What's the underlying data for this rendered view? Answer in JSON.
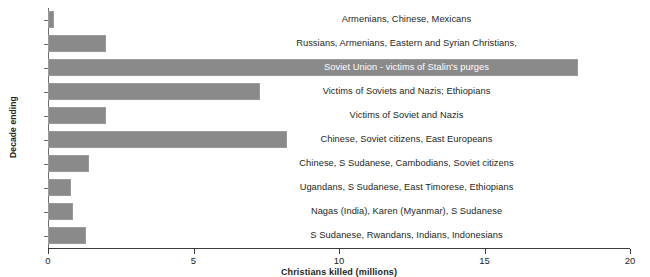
{
  "chart_data": {
    "type": "bar",
    "orientation": "horizontal",
    "title": "",
    "xlabel": "Christians killed (millions)",
    "ylabel": "Decade ending",
    "xlim": [
      0,
      20
    ],
    "xticks": [
      0,
      5,
      10,
      15,
      20
    ],
    "xtick_labels": [
      "0",
      "5",
      "10",
      "15",
      "20"
    ],
    "grid": false,
    "legend": "none",
    "bar_color": "#8a8a8a",
    "highlight_text_color": "#ffffff",
    "categories": [
      "1910",
      "1920",
      "1930",
      "1940",
      "1950",
      "1960",
      "1970",
      "1980",
      "1990",
      "2000"
    ],
    "values": [
      0.2,
      2.0,
      18.2,
      7.3,
      2.0,
      8.2,
      1.4,
      0.8,
      0.85,
      1.3
    ],
    "annotations": [
      "Armenians, Chinese, Mexicans",
      "Russians, Armenians, Eastern and Syrian Christians,",
      "Soviet Union - victims of Stalin's purges",
      "Victims of Soviets and Nazis; Ethiopians",
      "Victims of Soviet and Nazis",
      "Chinese, Soviet citizens, East Europeans",
      "Chinese, S Sudanese, Cambodians, Soviet citizens",
      "Ugandans, S Sudanese, East Timorese, Ethiopians",
      "Nagas (India), Karen (Myanmar),  S Sudanese",
      "S Sudanese, Rwandans, Indians, Indonesians"
    ],
    "annotation_on_bar": [
      false,
      false,
      true,
      false,
      false,
      false,
      false,
      false,
      false,
      false
    ]
  }
}
